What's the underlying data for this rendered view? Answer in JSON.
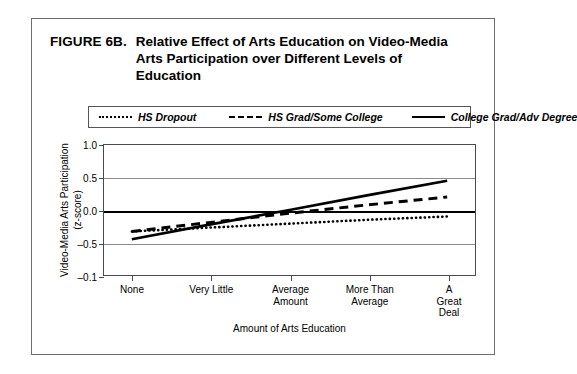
{
  "figure": {
    "label": "FIGURE 6B.",
    "title": "Relative Effect of Arts Education on Video-Media Arts Participation over Different Levels of Education"
  },
  "chart_data": {
    "type": "line",
    "title": "Relative Effect of Arts Education on Video-Media Arts Participation over Different Levels of Education",
    "xlabel": "Amount of Arts Education",
    "ylabel": "Video-Media Arts Participation",
    "ylabel_sub": "(z-score)",
    "categories": [
      "None",
      "Very Little",
      "Average\nAmount",
      "More Than\nAverage",
      "A Great Deal"
    ],
    "ytick_labels": [
      "1.0",
      "0.5",
      "0.0",
      "-0.5",
      "-0.1"
    ],
    "ytick_values": [
      1.0,
      0.5,
      0.0,
      -0.5,
      -1.0
    ],
    "ylim": [
      -1.0,
      1.0
    ],
    "grid": true,
    "zero_line": true,
    "legend_position": "above-plot",
    "series": [
      {
        "name": "HS Dropout",
        "style": "dotted",
        "values": [
          -0.33,
          -0.27,
          -0.21,
          -0.15,
          -0.1
        ]
      },
      {
        "name": "HS Grad/Some College",
        "style": "dashed",
        "values": [
          -0.33,
          -0.19,
          -0.05,
          0.08,
          0.2
        ]
      },
      {
        "name": "College Grad/Adv Degree",
        "style": "solid",
        "values": [
          -0.45,
          -0.22,
          0.0,
          0.23,
          0.45
        ]
      }
    ]
  }
}
